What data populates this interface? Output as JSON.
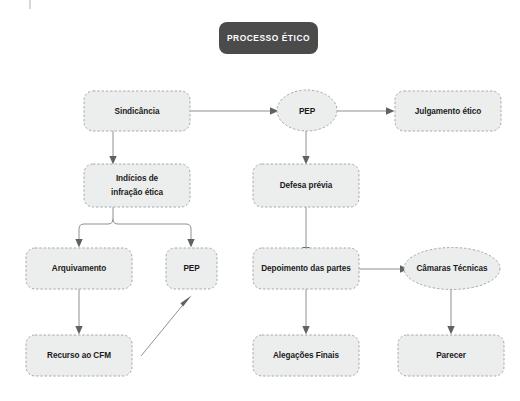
{
  "diagram": {
    "title": "PROCESSO ÉTICO",
    "colors": {
      "node_fill": "#eceded",
      "node_stroke": "#a6a8aa",
      "title_fill": "#4b4b4b",
      "title_text": "#ffffff",
      "edge": "#8d9094",
      "label_text": "#1b1b1b",
      "background": "#ffffff"
    },
    "nodes": [
      {
        "id": "processo-etico",
        "label": "PROCESSO ÉTICO",
        "shape": "rounded-rect",
        "style": "title"
      },
      {
        "id": "sindicancia",
        "label": "Sindicância",
        "shape": "rounded-rect"
      },
      {
        "id": "pep-top",
        "label": "PEP",
        "shape": "ellipse"
      },
      {
        "id": "julgamento-etico",
        "label": "Julgamento ético",
        "shape": "rounded-rect"
      },
      {
        "id": "indicios-infracao-etica",
        "label": "Indícios de infração ética",
        "line1": "Indícios de",
        "line2": "infração ética",
        "shape": "rounded-rect"
      },
      {
        "id": "defesa-previa",
        "label": "Defesa prévia",
        "shape": "rounded-rect"
      },
      {
        "id": "arquivamento",
        "label": "Arquivamento",
        "shape": "rounded-rect"
      },
      {
        "id": "pep-branch",
        "label": "PEP",
        "shape": "rounded-rect"
      },
      {
        "id": "depoimento-das-partes",
        "label": "Depoimento das partes",
        "shape": "rounded-rect"
      },
      {
        "id": "camaras-tecnicas",
        "label": "Câmaras Técnicas",
        "shape": "ellipse"
      },
      {
        "id": "recurso-ao-cfm",
        "label": "Recurso ao CFM",
        "shape": "rounded-rect"
      },
      {
        "id": "alegacoes-finais",
        "label": "Alegações Finais",
        "shape": "rounded-rect"
      },
      {
        "id": "parecer",
        "label": "Parecer",
        "shape": "rounded-rect"
      }
    ],
    "edges": [
      {
        "from": "sindicancia",
        "to": "pep-top",
        "type": "horizontal-arrow"
      },
      {
        "from": "pep-top",
        "to": "julgamento-etico",
        "type": "horizontal-arrow"
      },
      {
        "from": "sindicancia",
        "to": "indicios-infracao-etica",
        "type": "vertical-arrow"
      },
      {
        "from": "pep-top",
        "to": "defesa-previa",
        "type": "vertical-arrow"
      },
      {
        "from": "indicios-infracao-etica",
        "to": "arquivamento",
        "type": "fork-arrow"
      },
      {
        "from": "indicios-infracao-etica",
        "to": "pep-branch",
        "type": "fork-arrow"
      },
      {
        "from": "defesa-previa",
        "to": "depoimento-das-partes",
        "type": "vertical-arrow"
      },
      {
        "from": "arquivamento",
        "to": "recurso-ao-cfm",
        "type": "vertical-arrow"
      },
      {
        "from": "recurso-ao-cfm",
        "to": "pep-branch",
        "type": "diagonal-arrow"
      },
      {
        "from": "depoimento-das-partes",
        "to": "camaras-tecnicas",
        "type": "horizontal-arrow"
      },
      {
        "from": "depoimento-das-partes",
        "to": "alegacoes-finais",
        "type": "vertical-arrow"
      },
      {
        "from": "camaras-tecnicas",
        "to": "parecer",
        "type": "vertical-arrow"
      }
    ]
  }
}
